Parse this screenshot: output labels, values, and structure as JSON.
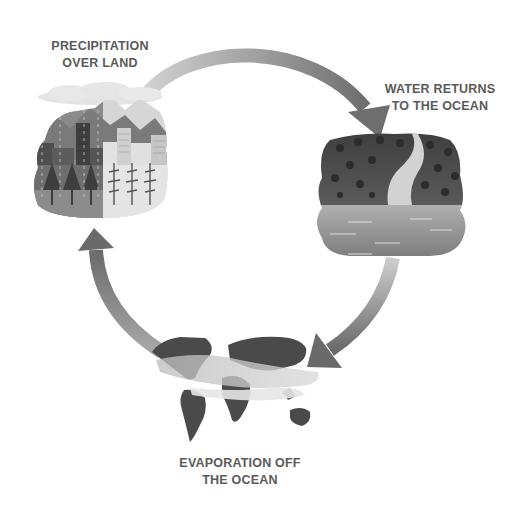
{
  "diagram": {
    "palette": {
      "arrow_dark": "#6b6b6b",
      "arrow_light": "#c4c4c4",
      "land_dark": "#4a4a4a",
      "land_mid": "#8a8a8a",
      "land_light": "#d8d8d8",
      "ocean": "#9a9a9a",
      "text": "#5a5a5a"
    },
    "stages": [
      {
        "id": "precipitation",
        "lines": [
          "PRECIPITATION",
          "OVER LAND"
        ],
        "illustration": "city-and-forest-under-rain-cloud"
      },
      {
        "id": "runoff",
        "lines": [
          "WATER RETURNS",
          "TO THE OCEAN"
        ],
        "illustration": "river-through-forest-into-ocean"
      },
      {
        "id": "evaporation",
        "lines": [
          "EVAPORATION OFF",
          "THE OCEAN"
        ],
        "illustration": "world-map-with-evaporation-bands"
      }
    ],
    "arrows": [
      {
        "from": "precipitation",
        "to": "runoff",
        "direction": "clockwise"
      },
      {
        "from": "runoff",
        "to": "evaporation",
        "direction": "clockwise"
      },
      {
        "from": "evaporation",
        "to": "precipitation",
        "direction": "clockwise"
      }
    ]
  }
}
